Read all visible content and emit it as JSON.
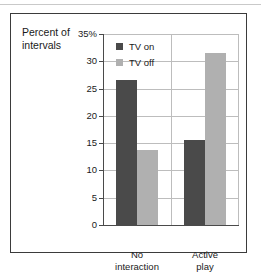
{
  "chart_data": {
    "type": "bar",
    "title": "Percent of\nintervals",
    "xlabel": "",
    "ylabel": "Percent of intervals",
    "categories": [
      "No\ninteraction",
      "Active\nplay"
    ],
    "series": [
      {
        "name": "TV on",
        "color": "#4a4a4a",
        "values": [
          26.5,
          15.6
        ]
      },
      {
        "name": "TV off",
        "color": "#b0b0b0",
        "values": [
          13.7,
          31.5
        ]
      }
    ],
    "ylim": [
      0,
      35
    ],
    "ytick_values": [
      35,
      30,
      25,
      20,
      15,
      10,
      5,
      0
    ],
    "ytick_labels": [
      "35%",
      "30",
      "25",
      "20",
      "15",
      "10",
      "5",
      "0"
    ],
    "grid": true,
    "legend_position": "inside-top-left"
  },
  "axis": {
    "tick_0": "35%",
    "tick_1": "30",
    "tick_2": "25",
    "tick_3": "20",
    "tick_4": "15",
    "tick_5": "10",
    "tick_6": "5",
    "tick_7": "0"
  },
  "legend": {
    "entry_0": "TV on",
    "entry_1": "TV off"
  },
  "categories": {
    "cat_0": "No\ninteraction",
    "cat_1": "Active\nplay"
  },
  "colors": {
    "tv_on": "#4a4a4a",
    "tv_off": "#b0b0b0",
    "grid": "#bdbdbd",
    "axis": "#4a4a4a",
    "frame": "#3b3b3b"
  }
}
